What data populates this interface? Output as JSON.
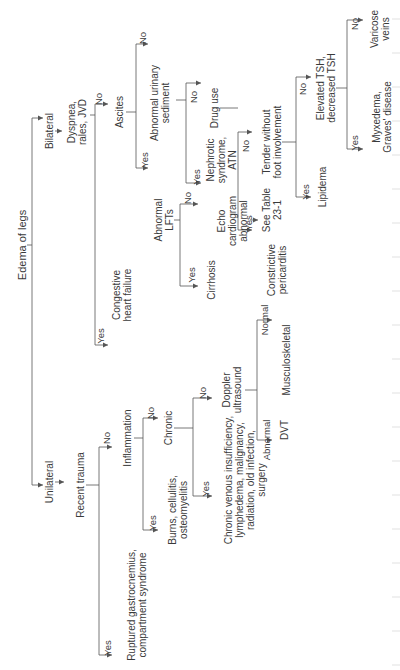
{
  "diagram": {
    "title": "Edema of legs",
    "nodes": {
      "root": "Edema of legs",
      "bilateral": "Bilateral",
      "unilateral": "Unilateral",
      "dyspnea": "Dyspnea,\nrales, JVD",
      "chf": "Congestive\nheart failure",
      "ascites": "Ascites",
      "abnormal_lfts": "Abnormal\nLFTs",
      "cirrhosis": "Cirrhosis",
      "echo": "Echo\ncardiogram\nabnormal",
      "constrictive": "Constrictive\npericarditis",
      "urinary": "Abnormal urinary\nsediment",
      "nephrotic": "Nephrotic\nsyndrome,\nATN",
      "drug_use": "Drug use",
      "see_table": "See Table\n23-1",
      "tender": "Tender without\nfoot involvement",
      "lipidema": "Lipidema",
      "tsh": "Elevated TSH,\ndecreased TSH",
      "myxedema": "Myxedema,\nGraves' disease",
      "varicose": "Varicose\nveins",
      "recent_trauma": "Recent trauma",
      "ruptured": "Ruptured gastrocnemius,\ncompartment syndrome",
      "inflammation": "Inflammation",
      "burns": "Burns, cellulitis,\nosteomyelitis",
      "chronic": "Chronic",
      "chronic_list": "Chronic venous insufficiency,\nlymphedema, malignancy,\nradiation, old infection,\nsurgery",
      "doppler": "Doppler\nultrasound",
      "dvt": "DVT",
      "musculoskeletal": "Musculoskeletal"
    },
    "answers": {
      "yes": "Yes",
      "no": "No",
      "abnormal": "Abnormal",
      "normal": "Normal"
    },
    "line_color": "#555555"
  }
}
